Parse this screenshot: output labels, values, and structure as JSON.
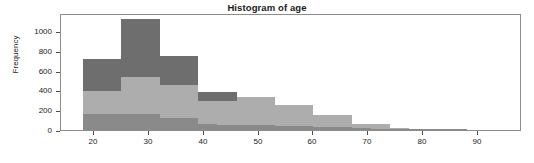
{
  "chart_data": {
    "type": "bar",
    "title": "Histogram of age",
    "xlabel": "",
    "ylabel": "Frequency",
    "xlim": [
      14,
      98
    ],
    "ylim": [
      0,
      1180
    ],
    "grid": false,
    "legend": null,
    "xticks": [
      20,
      30,
      40,
      50,
      60,
      70,
      80,
      90
    ],
    "yticks": [
      0,
      200,
      400,
      600,
      800,
      1000
    ],
    "bin_width": 3.5,
    "colors": {
      "series_back": "#6e6e6e",
      "series_mid": "#adadad",
      "series_front": "#8a8a8a",
      "frame": "#8c8c8c",
      "text": "#1a1a1a"
    },
    "series": [
      {
        "name": "back",
        "color": "#6e6e6e",
        "bin_starts": [
          18,
          21.5,
          25,
          28.5,
          32,
          35.5,
          39,
          42.5
        ],
        "values": [
          715,
          715,
          1120,
          1120,
          750,
          750,
          385,
          385
        ]
      },
      {
        "name": "mid",
        "color": "#adadad",
        "bin_starts": [
          18,
          21.5,
          25,
          28.5,
          32,
          35.5,
          39,
          42.5,
          46,
          49.5,
          53,
          56.5,
          60,
          63.5,
          67,
          70.5,
          74,
          77.5,
          81,
          84.5
        ],
        "values": [
          395,
          395,
          535,
          535,
          455,
          455,
          290,
          290,
          335,
          335,
          255,
          255,
          150,
          150,
          60,
          60,
          20,
          12,
          5,
          2
        ]
      },
      {
        "name": "front",
        "color": "#8a8a8a",
        "bin_starts": [
          18,
          21.5,
          25,
          28.5,
          32,
          35.5,
          39,
          42.5,
          46,
          49.5,
          53,
          56.5,
          60,
          63.5,
          67,
          70.5,
          74,
          77.5,
          81,
          84.5
        ],
        "values": [
          165,
          165,
          165,
          165,
          120,
          120,
          62,
          55,
          50,
          48,
          45,
          40,
          32,
          28,
          20,
          14,
          10,
          6,
          4,
          2
        ]
      }
    ]
  }
}
